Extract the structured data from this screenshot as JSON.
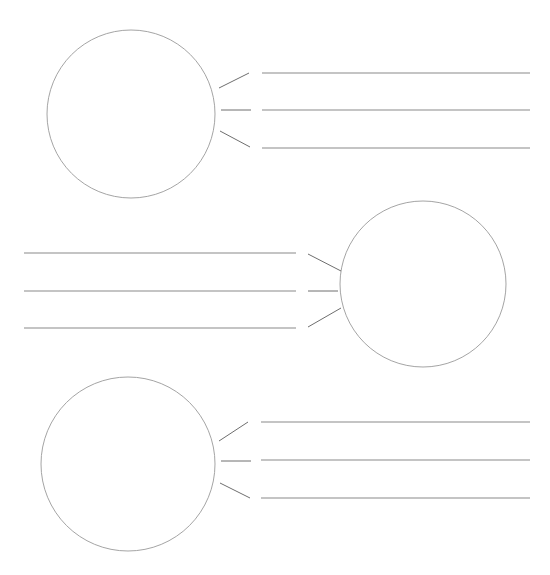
{
  "canvas": {
    "width": 550,
    "height": 575,
    "background_color": "#ffffff"
  },
  "style": {
    "circle_stroke_color": "#9a9a9a",
    "circle_stroke_width": 0.9,
    "line_stroke_color": "#8a8a8a",
    "line_stroke_width": 1.1,
    "whisker_stroke_color": "#6e6e6e",
    "whisker_stroke_width": 1.0
  },
  "chart_data": {
    "type": "diagram",
    "title": "",
    "subtitle": "",
    "xlabel": "",
    "ylabel": "",
    "groups": [
      {
        "id": "group-top",
        "name": "top-group",
        "orientation": "circle-left",
        "circle": {
          "cx": 131,
          "cy": 114,
          "r": 84
        },
        "whiskers": [
          {
            "x1": 219,
            "y1": 88,
            "x2": 249,
            "y2": 73
          },
          {
            "x1": 221,
            "y1": 110,
            "x2": 251,
            "y2": 110
          },
          {
            "x1": 220,
            "y1": 131,
            "x2": 250,
            "y2": 147
          }
        ],
        "rules": [
          {
            "x1": 262,
            "y1": 73,
            "x2": 530,
            "y2": 73
          },
          {
            "x1": 262,
            "y1": 110,
            "x2": 530,
            "y2": 110
          },
          {
            "x1": 262,
            "y1": 148,
            "x2": 530,
            "y2": 148
          }
        ]
      },
      {
        "id": "group-middle",
        "name": "middle-group",
        "orientation": "circle-right",
        "circle": {
          "cx": 423,
          "cy": 284,
          "r": 83
        },
        "whiskers": [
          {
            "x1": 308,
            "y1": 254,
            "x2": 341,
            "y2": 271
          },
          {
            "x1": 308,
            "y1": 291,
            "x2": 338,
            "y2": 291
          },
          {
            "x1": 308,
            "y1": 327,
            "x2": 341,
            "y2": 308
          }
        ],
        "rules": [
          {
            "x1": 24,
            "y1": 253,
            "x2": 296,
            "y2": 253
          },
          {
            "x1": 24,
            "y1": 291,
            "x2": 296,
            "y2": 291
          },
          {
            "x1": 24,
            "y1": 328,
            "x2": 296,
            "y2": 328
          }
        ]
      },
      {
        "id": "group-bottom",
        "name": "bottom-group",
        "orientation": "circle-left",
        "circle": {
          "cx": 128,
          "cy": 464,
          "r": 87
        },
        "whiskers": [
          {
            "x1": 219,
            "y1": 441,
            "x2": 248,
            "y2": 422
          },
          {
            "x1": 221,
            "y1": 461,
            "x2": 251,
            "y2": 461
          },
          {
            "x1": 220,
            "y1": 483,
            "x2": 250,
            "y2": 498
          }
        ],
        "rules": [
          {
            "x1": 261,
            "y1": 422,
            "x2": 530,
            "y2": 422
          },
          {
            "x1": 261,
            "y1": 460,
            "x2": 530,
            "y2": 460
          },
          {
            "x1": 261,
            "y1": 498,
            "x2": 530,
            "y2": 498
          }
        ]
      }
    ]
  }
}
